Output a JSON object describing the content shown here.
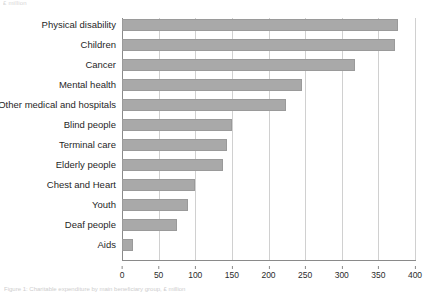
{
  "page": {
    "header_fragment": "£ million",
    "caption_fragment": "Figure 1: Charitable expenditure by main beneficiary group, £ million"
  },
  "chart_data": {
    "type": "bar",
    "orientation": "horizontal",
    "title": "",
    "subtitle": "",
    "xlabel": "",
    "ylabel": "",
    "xlim": [
      0,
      400
    ],
    "xticks": [
      0,
      50,
      100,
      150,
      200,
      250,
      300,
      350,
      400
    ],
    "xtick_labels": [
      "0",
      "50",
      "100",
      "150",
      "200",
      "250",
      "300",
      "350",
      "400"
    ],
    "grid": "vertical",
    "legend": "none",
    "bar_color": "#a9a9a9",
    "bar_edge_color": "#9a9a9a",
    "grid_color": "#d0d0d0",
    "axis_color": "#8a8a8a",
    "categories": [
      "Physical disability",
      "Children",
      "Cancer",
      "Mental health",
      "Other medical and hospitals",
      "Blind people",
      "Terminal care",
      "Elderly people",
      "Chest and Heart",
      "Youth",
      "Deaf people",
      "Aids"
    ],
    "values": [
      377,
      373,
      318,
      246,
      224,
      150,
      143,
      138,
      100,
      90,
      75,
      15
    ]
  }
}
